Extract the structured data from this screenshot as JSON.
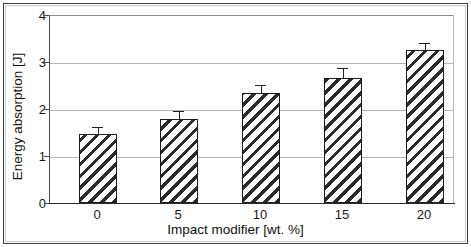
{
  "chart_data": {
    "type": "bar",
    "title": "",
    "xlabel": "Impact modifier [wt. %]",
    "ylabel": "Energy absorption [J]",
    "categories": [
      "0",
      "5",
      "10",
      "15",
      "20"
    ],
    "values": [
      1.48,
      1.8,
      2.36,
      2.68,
      3.28
    ],
    "errors": [
      0.13,
      0.14,
      0.15,
      0.18,
      0.13
    ],
    "ylim": [
      0,
      4
    ],
    "yticks": [
      0,
      1,
      2,
      3,
      4
    ],
    "ytick_labels": [
      "0",
      "1",
      "2",
      "3",
      "4"
    ],
    "grid": "horizontal",
    "legend": "none",
    "bar_style": "diagonal-hatch",
    "error_bar_style": "capped-vertical"
  },
  "axes": {
    "y_title": "Energy absorption [J]",
    "x_title": "Impact modifier [wt. %]",
    "y_labels": [
      "4",
      "3",
      "2",
      "1",
      "0"
    ],
    "x_labels": [
      "0",
      "5",
      "10",
      "15",
      "20"
    ]
  },
  "colors": {
    "bar_fill": "#ffffff",
    "bar_hatch": "#2a2a2a",
    "bar_edge": "#1c1c1c",
    "gridline": "#b5b5b5",
    "axis": "#2b2b2b",
    "text": "#111111",
    "frame": "#3a3a3a",
    "background": "#ffffff"
  }
}
